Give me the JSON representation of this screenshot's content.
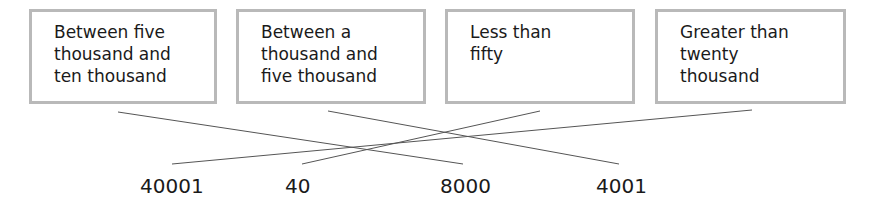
{
  "diagram": {
    "type": "matching",
    "boxes": [
      {
        "label": "Between five\nthousand and\nten thousand"
      },
      {
        "label": "Between a\nthousand and\nfive thousand"
      },
      {
        "label": "Less than\nfifty"
      },
      {
        "label": "Greater than\ntwenty\nthousand"
      }
    ],
    "numbers": [
      {
        "label": "40001"
      },
      {
        "label": "40"
      },
      {
        "label": "8000"
      },
      {
        "label": "4001"
      }
    ],
    "connections": [
      {
        "from_box": "Between five thousand and ten thousand",
        "to_number": "8000"
      },
      {
        "from_box": "Between a thousand and five thousand",
        "to_number": "4001"
      },
      {
        "from_box": "Less than fifty",
        "to_number": "40"
      },
      {
        "from_box": "Greater than twenty thousand",
        "to_number": "40001"
      }
    ],
    "colors": {
      "box_border": "#b9b9b9",
      "line": "#555555",
      "text": "#1a1a1a"
    }
  }
}
